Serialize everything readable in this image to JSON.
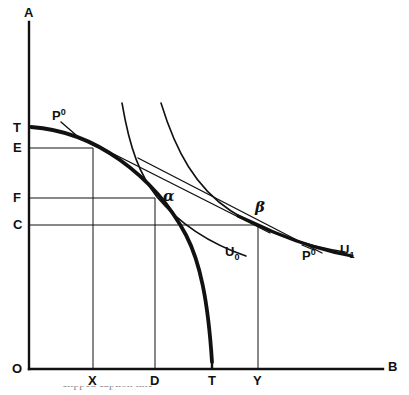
{
  "figure": {
    "type": "economics-diagram",
    "background_color": "#ffffff",
    "ink_color": "#111111"
  },
  "axes": {
    "vertical_label": "A",
    "horizontal_label": "B",
    "origin_label": "O",
    "vertical_ticks": [
      {
        "label": "T",
        "y": 128
      },
      {
        "label": "E",
        "y": 148
      },
      {
        "label": "F",
        "y": 198
      },
      {
        "label": "C",
        "y": 225
      }
    ],
    "horizontal_ticks": [
      {
        "label": "X",
        "x": 93
      },
      {
        "label": "D",
        "x": 155
      },
      {
        "label": "T",
        "x": 212
      },
      {
        "label": "Y",
        "x": 258
      }
    ]
  },
  "curves": {
    "ppf": {
      "name": "production-possibility-frontier",
      "label": "",
      "intercept_vertical": "T",
      "intercept_horizontal": "T",
      "style": "thick"
    },
    "indifference_low": {
      "name": "indifference-curve-u0",
      "label": "U",
      "label_sub": "0",
      "style": "thin"
    },
    "indifference_high": {
      "name": "indifference-curve-u1",
      "label": "U",
      "label_sub": "1",
      "style": "thin"
    },
    "price_line_upper": {
      "name": "price-line-p0-upper",
      "label": "P",
      "label_sup": "0",
      "style": "thin"
    },
    "price_line_lower": {
      "name": "price-line-p0-lower",
      "label": "P",
      "label_sup": "0",
      "style": "thin"
    }
  },
  "points": {
    "alpha": {
      "label": "α",
      "x": 155,
      "y": 198
    },
    "beta": {
      "label": "β",
      "x": 258,
      "y": 225
    }
  },
  "caption": {
    "text": "clipped caption line"
  }
}
